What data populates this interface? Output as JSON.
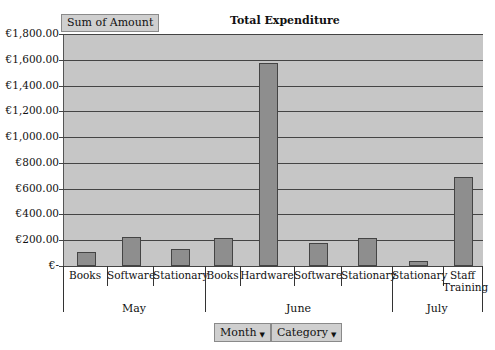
{
  "header": {
    "data_field_button": "Sum of Amount",
    "title": "Total Expenditure"
  },
  "pivot_fields": [
    {
      "label": "Month",
      "icon": "dropdown-arrow-icon"
    },
    {
      "label": "Category",
      "icon": "dropdown-arrow-icon"
    }
  ],
  "colors": {
    "plot_background": "#c6c6c6",
    "bar_fill": "#8e8e8e",
    "gridline": "#444444",
    "button_fill": "#cfcfcf"
  },
  "chart_data": {
    "type": "bar",
    "title": "Total Expenditure",
    "xlabel": "",
    "ylabel": "Sum of Amount",
    "ylim": [
      0,
      1800
    ],
    "yticks": [
      "€-",
      "€200.00",
      "€400.00",
      "€600.00",
      "€800.00",
      "€1,000.00",
      "€1,200.00",
      "€1,400.00",
      "€1,600.00",
      "€1,800.00"
    ],
    "grid": true,
    "legend": "none",
    "groups": [
      {
        "month": "May",
        "categories": [
          "Books",
          "Software",
          "Stationary"
        ],
        "values": [
          110,
          225,
          130
        ]
      },
      {
        "month": "June",
        "categories": [
          "Books",
          "Hardware",
          "Software",
          "Stationary"
        ],
        "values": [
          220,
          1575,
          180,
          215
        ]
      },
      {
        "month": "July",
        "categories": [
          "Stationary",
          "Staff Training"
        ],
        "values": [
          40,
          690
        ]
      }
    ],
    "categories": [
      "May/Books",
      "May/Software",
      "May/Stationary",
      "June/Books",
      "June/Hardware",
      "June/Software",
      "June/Stationary",
      "July/Stationary",
      "July/Staff Training"
    ],
    "values": [
      110,
      225,
      130,
      220,
      1575,
      180,
      215,
      40,
      690
    ]
  }
}
